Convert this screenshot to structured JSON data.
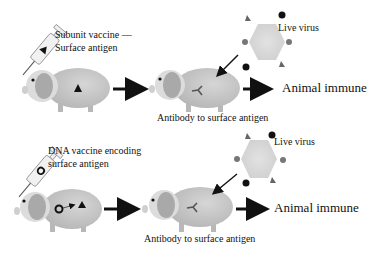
{
  "panels": [
    {
      "id": "subunit",
      "vaccine_label_line1": "Subunit vaccine —",
      "vaccine_label_line2": "Surface antigen",
      "challenge_label": "Live virus",
      "antibody_label": "Antibody to surface antigen",
      "outcome_label": "Animal immune"
    },
    {
      "id": "dna",
      "vaccine_label_line1": "DNA vaccine encoding",
      "vaccine_label_line2": "surface antigen",
      "challenge_label": "Live virus",
      "antibody_label": "Antibody to surface antigen",
      "outcome_label": "Animal immune"
    }
  ],
  "colors": {
    "pig_body": "#c8c8c8",
    "pig_head": "#d8d8d8",
    "pig_ear": "#a8a8a8",
    "virus_fill": "#d9d9d9",
    "arrow": "#111111",
    "syringe": "#e8e8e8"
  }
}
